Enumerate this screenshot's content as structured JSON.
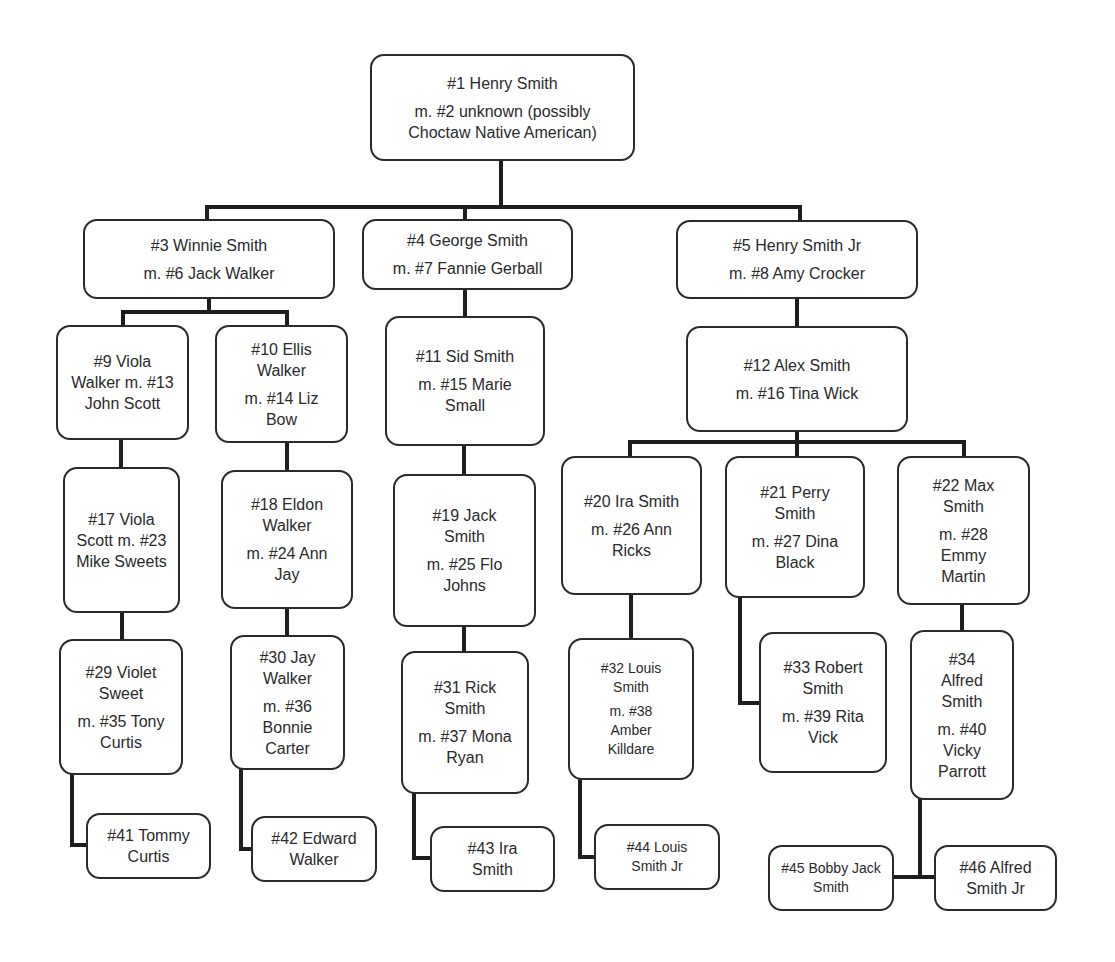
{
  "colors": {
    "line": "#1e1e1e",
    "box_border": "#2a2a2a",
    "text": "#2a2a2a",
    "background": "#ffffff"
  },
  "nodes": {
    "n1": {
      "name": "#1 Henry Smith",
      "spouse": "m. #2 unknown (possibly Choctaw Native American)"
    },
    "n3": {
      "name": "#3 Winnie Smith",
      "spouse": "m. #6 Jack Walker"
    },
    "n4": {
      "name": "#4 George Smith",
      "spouse": "m. #7 Fannie Gerball"
    },
    "n5": {
      "name": "#5 Henry Smith Jr",
      "spouse": "m. #8 Amy Crocker"
    },
    "n9": {
      "name": "#9 Viola Walker m. #13 John Scott",
      "spouse": ""
    },
    "n10": {
      "name": "#10 Ellis Walker",
      "spouse": "m. #14 Liz Bow"
    },
    "n11": {
      "name": "#11 Sid Smith",
      "spouse": "m. #15 Marie Small"
    },
    "n12": {
      "name": "#12 Alex Smith",
      "spouse": "m. #16 Tina Wick"
    },
    "n17": {
      "name": "#17 Viola Scott m. #23 Mike Sweets",
      "spouse": ""
    },
    "n18": {
      "name": "#18 Eldon Walker",
      "spouse": "m. #24 Ann Jay"
    },
    "n19": {
      "name": "#19 Jack Smith",
      "spouse": "m. #25 Flo Johns"
    },
    "n20": {
      "name": "#20 Ira Smith",
      "spouse": "m. #26 Ann Ricks"
    },
    "n21": {
      "name": "#21 Perry Smith",
      "spouse": "m. #27 Dina Black"
    },
    "n22": {
      "name": "#22 Max Smith",
      "spouse": "m. #28 Emmy Martin"
    },
    "n29": {
      "name": "#29 Violet Sweet",
      "spouse": "m. #35 Tony Curtis"
    },
    "n30": {
      "name": "#30 Jay Walker",
      "spouse": "m. #36 Bonnie Carter"
    },
    "n31": {
      "name": "#31 Rick Smith",
      "spouse": "m. #37 Mona Ryan"
    },
    "n32": {
      "name": "#32 Louis Smith",
      "spouse": "m. #38 Amber Killdare"
    },
    "n33": {
      "name": "#33 Robert Smith",
      "spouse": "m. #39 Rita Vick"
    },
    "n34": {
      "name": "#34 Alfred Smith",
      "spouse": "m. #40 Vicky Parrott"
    },
    "n41": {
      "name": "#41 Tommy Curtis",
      "spouse": ""
    },
    "n42": {
      "name": "#42 Edward Walker",
      "spouse": ""
    },
    "n43": {
      "name": "#43 Ira Smith",
      "spouse": ""
    },
    "n44": {
      "name": "#44 Louis Smith Jr",
      "spouse": ""
    },
    "n45": {
      "name": "#45 Bobby Jack Smith",
      "spouse": ""
    },
    "n46": {
      "name": "#46 Alfred Smith Jr",
      "spouse": ""
    }
  },
  "edges": [
    [
      "n1",
      "n3"
    ],
    [
      "n1",
      "n4"
    ],
    [
      "n1",
      "n5"
    ],
    [
      "n3",
      "n9"
    ],
    [
      "n3",
      "n10"
    ],
    [
      "n4",
      "n11"
    ],
    [
      "n5",
      "n12"
    ],
    [
      "n9",
      "n17"
    ],
    [
      "n10",
      "n18"
    ],
    [
      "n11",
      "n19"
    ],
    [
      "n12",
      "n20"
    ],
    [
      "n12",
      "n21"
    ],
    [
      "n12",
      "n22"
    ],
    [
      "n17",
      "n29"
    ],
    [
      "n18",
      "n30"
    ],
    [
      "n19",
      "n31"
    ],
    [
      "n20",
      "n32"
    ],
    [
      "n21",
      "n33"
    ],
    [
      "n22",
      "n34"
    ],
    [
      "n29",
      "n41"
    ],
    [
      "n30",
      "n42"
    ],
    [
      "n31",
      "n43"
    ],
    [
      "n32",
      "n44"
    ],
    [
      "n34",
      "n45"
    ],
    [
      "n34",
      "n46"
    ]
  ]
}
